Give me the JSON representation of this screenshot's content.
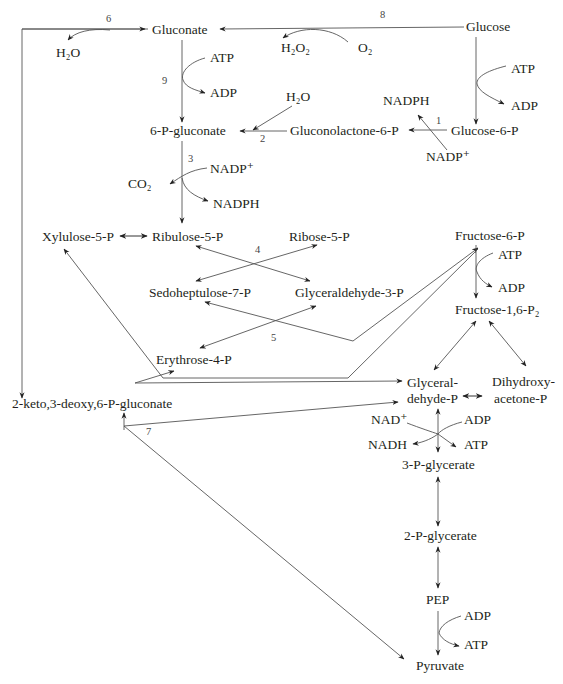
{
  "colors": {
    "line": "#555555",
    "text": "#231f20",
    "background": "#ffffff"
  },
  "nodes": {
    "gluconate": {
      "label": "Gluconate",
      "x": 152,
      "y": 35
    },
    "glucose": {
      "label": "Glucose",
      "x": 470,
      "y": 31
    },
    "h2o_6": {
      "label": "H₂O",
      "x": 58,
      "y": 57
    },
    "h2o2": {
      "label": "H₂O₂",
      "x": 283,
      "y": 50
    },
    "o2": {
      "label": "O₂",
      "x": 358,
      "y": 50
    },
    "atp_9": {
      "label": "ATP",
      "x": 210,
      "y": 61
    },
    "adp_9": {
      "label": "ADP",
      "x": 210,
      "y": 98
    },
    "atp_hk": {
      "label": "ATP",
      "x": 511,
      "y": 72
    },
    "adp_hk": {
      "label": "ADP",
      "x": 511,
      "y": 110
    },
    "h2o_2": {
      "label": "H₂O",
      "x": 285,
      "y": 102
    },
    "nadph_1": {
      "label": "NADPH",
      "x": 383,
      "y": 106
    },
    "six_p_gluconate": {
      "label": "6-P-gluconate",
      "x": 148,
      "y": 136
    },
    "gluconolactone": {
      "label": "Gluconolactone-6-P",
      "x": 290,
      "y": 136
    },
    "glucose_6_p": {
      "label": "Glucose-6-P",
      "x": 452,
      "y": 136
    },
    "nadp_1": {
      "label": "NADP⁺",
      "x": 425,
      "y": 162
    },
    "nadp_3": {
      "label": "NADP⁺",
      "x": 210,
      "y": 172
    },
    "co2": {
      "label": "CO₂",
      "x": 128,
      "y": 186
    },
    "nadph_3": {
      "label": "NADPH",
      "x": 214,
      "y": 206
    },
    "xylulose": {
      "label": "Xylulose-5-P",
      "x": 42,
      "y": 241
    },
    "ribulose": {
      "label": "Ribulose-5-P",
      "x": 152,
      "y": 241
    },
    "ribose": {
      "label": "Ribose-5-P",
      "x": 289,
      "y": 241
    },
    "fructose_6_p": {
      "label": "Fructose-6-P",
      "x": 455,
      "y": 240
    },
    "atp_pfk": {
      "label": "ATP",
      "x": 498,
      "y": 258
    },
    "adp_pfk": {
      "label": "ADP",
      "x": 498,
      "y": 291
    },
    "sedoheptulose": {
      "label": "Sedoheptulose-7-P",
      "x": 149,
      "y": 296
    },
    "glyceraldehyde_3_p": {
      "label": "Glyceraldehyde-3-P",
      "x": 295,
      "y": 296
    },
    "fructose_16": {
      "label": "Fructose-1,6-P₂",
      "x": 455,
      "y": 314
    },
    "erythrose": {
      "label": "Erythrose-4-P",
      "x": 156,
      "y": 364
    },
    "kdpg": {
      "label": "2-keto,3-deoxy,6-P-gluconate",
      "x": 12,
      "y": 408
    },
    "glyceral_1": {
      "label": "Glyceral-",
      "x": 407,
      "y": 387
    },
    "glyceral_2": {
      "label": "dehyde-P",
      "x": 407,
      "y": 404
    },
    "dhap_1": {
      "label": "Dihydroxy-",
      "x": 492,
      "y": 386
    },
    "dhap_2": {
      "label": "acetone-P",
      "x": 495,
      "y": 403
    },
    "nad": {
      "label": "NAD⁺",
      "x": 372,
      "y": 425
    },
    "adp_gap": {
      "label": "ADP",
      "x": 465,
      "y": 425
    },
    "nadh": {
      "label": "NADH",
      "x": 368,
      "y": 450
    },
    "atp_gap": {
      "label": "ATP",
      "x": 465,
      "y": 450
    },
    "three_pg": {
      "label": "3-P-glycerate",
      "x": 402,
      "y": 470
    },
    "two_pg": {
      "label": "2-P-glycerate",
      "x": 404,
      "y": 540
    },
    "pep": {
      "label": "PEP",
      "x": 427,
      "y": 605
    },
    "adp_pk": {
      "label": "ADP",
      "x": 465,
      "y": 621
    },
    "atp_pk": {
      "label": "ATP",
      "x": 465,
      "y": 650
    },
    "pyruvate": {
      "label": "Pyruvate",
      "x": 416,
      "y": 671
    }
  },
  "enzyme_numbers": [
    {
      "label": "6",
      "x": 106,
      "y": 22
    },
    {
      "label": "8",
      "x": 380,
      "y": 18
    },
    {
      "label": "9",
      "x": 162,
      "y": 84
    },
    {
      "label": "1",
      "x": 436,
      "y": 124
    },
    {
      "label": "2",
      "x": 260,
      "y": 142
    },
    {
      "label": "3",
      "x": 188,
      "y": 162
    },
    {
      "label": "4",
      "x": 255,
      "y": 253
    },
    {
      "label": "5",
      "x": 271,
      "y": 341
    },
    {
      "label": "7",
      "x": 146,
      "y": 435
    }
  ],
  "reactions": [
    {
      "id": 1,
      "from": "Glucose-6-P",
      "to": "Gluconolactone-6-P",
      "cofactors": "NADP⁺ → NADPH"
    },
    {
      "id": 2,
      "from": "Gluconolactone-6-P",
      "to": "6-P-gluconate",
      "cofactors": "H₂O"
    },
    {
      "id": 3,
      "from": "6-P-gluconate",
      "to": "Ribulose-5-P",
      "cofactors": "NADP⁺ → NADPH, CO₂"
    },
    {
      "id": 4,
      "from": "Ribulose-5-P + Ribose-5-P",
      "to": "Sedoheptulose-7-P + Glyceraldehyde-3-P",
      "cofactors": ""
    },
    {
      "id": 5,
      "from": "Sedoheptulose-7-P + Glyceraldehyde-3-P",
      "to": "Erythrose-4-P + Fructose-6-P",
      "cofactors": ""
    },
    {
      "id": 6,
      "from": "6-P-gluconate",
      "to": "2-keto,3-deoxy,6-P-gluconate",
      "cofactors": "H₂O"
    },
    {
      "id": 7,
      "from": "2-keto,3-deoxy,6-P-gluconate",
      "to": "Glyceraldehyde-P + Pyruvate",
      "cofactors": ""
    },
    {
      "id": 8,
      "from": "Glucose",
      "to": "Gluconate",
      "cofactors": "O₂ → H₂O₂"
    },
    {
      "id": 9,
      "from": "Gluconate",
      "to": "6-P-gluconate",
      "cofactors": "ATP → ADP"
    }
  ]
}
